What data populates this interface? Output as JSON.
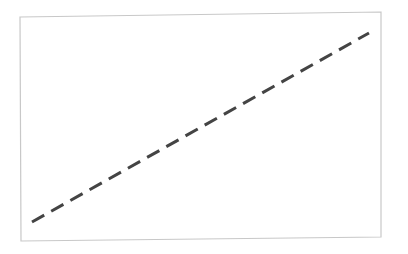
{
  "chart_data": {
    "type": "line",
    "title": "",
    "xlabel": "",
    "ylabel": "",
    "grid": false,
    "legend": null,
    "series": [
      {
        "name": "",
        "style": "dashed",
        "color": "#444444",
        "x": [
          0,
          1
        ],
        "y": [
          0,
          1
        ]
      }
    ],
    "xlim": [
      0,
      1
    ],
    "ylim": [
      0,
      1
    ]
  },
  "colors": {
    "frame": "#c8c8c8",
    "line": "#444444",
    "background": "#ffffff"
  }
}
